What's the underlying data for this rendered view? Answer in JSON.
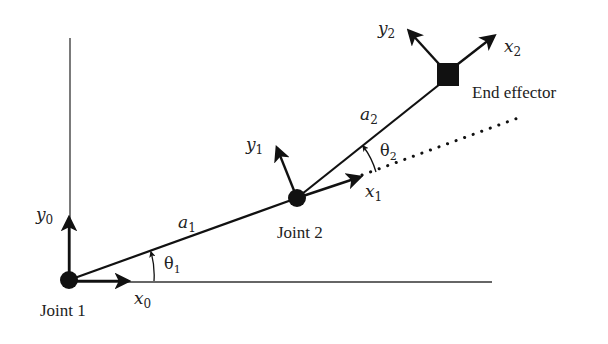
{
  "diagram": {
    "stroke_color": "#111111",
    "background": "#ffffff",
    "joints": [
      {
        "label": "Joint 1",
        "x": 69,
        "y": 280
      },
      {
        "label": "Joint 2",
        "x": 297,
        "y": 198
      }
    ],
    "end_effector": {
      "label": "End effector",
      "x": 448,
      "y": 74,
      "size": 22
    },
    "links": [
      {
        "label_var": "a",
        "label_sub": "1"
      },
      {
        "label_var": "a",
        "label_sub": "2"
      }
    ],
    "angles": [
      {
        "label_var": "θ",
        "label_sub": "1"
      },
      {
        "label_var": "θ",
        "label_sub": "2"
      }
    ],
    "frames": [
      {
        "x_var": "x",
        "x_sub": "0",
        "y_var": "y",
        "y_sub": "0"
      },
      {
        "x_var": "x",
        "x_sub": "1",
        "y_var": "y",
        "y_sub": "1"
      },
      {
        "x_var": "x",
        "x_sub": "2",
        "y_var": "y",
        "y_sub": "2"
      }
    ]
  }
}
